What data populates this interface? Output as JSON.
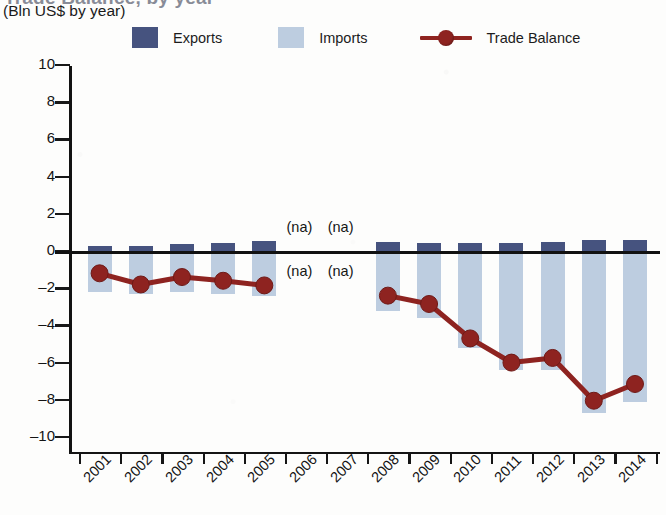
{
  "header": {
    "title_clipped": "Trade Balance, by year",
    "subtitle": "(Bln US$ by year)"
  },
  "legend": {
    "items": [
      {
        "label": "Exports",
        "color": "#46537f",
        "marker": "square"
      },
      {
        "label": "Imports",
        "color": "#bdcde0",
        "marker": "square"
      },
      {
        "label": "Trade Balance",
        "color": "#8e2320",
        "marker": "line-dot"
      }
    ]
  },
  "chart_data": {
    "type": "bar",
    "title": "Trade Balance, by year",
    "subtitle": "(Bln US$ by year)",
    "xlabel": "",
    "ylabel": "Bln US$",
    "ylim": [
      -10,
      10
    ],
    "yticks": [
      10,
      8,
      6,
      4,
      2,
      0,
      -2,
      -4,
      -6,
      -8,
      -10
    ],
    "grid": false,
    "legend_position": "top",
    "categories": [
      "2001",
      "2002",
      "2003",
      "2004",
      "2005",
      "2006",
      "2007",
      "2008",
      "2009",
      "2010",
      "2011",
      "2012",
      "2013",
      "2014"
    ],
    "series": [
      {
        "name": "Exports",
        "color": "#46537f",
        "values": [
          0.25,
          0.25,
          0.35,
          0.45,
          0.55,
          null,
          null,
          0.5,
          0.45,
          0.45,
          0.45,
          0.5,
          0.6,
          0.6
        ]
      },
      {
        "name": "Imports",
        "color": "#bdcde0",
        "values": [
          -2.2,
          -2.3,
          -2.2,
          -2.3,
          -2.4,
          null,
          null,
          -3.2,
          -3.6,
          -5.2,
          -6.4,
          -6.4,
          -8.7,
          -8.1
        ]
      },
      {
        "name": "Trade Balance",
        "color": "#8e2320",
        "values": [
          -1.2,
          -1.8,
          -1.4,
          -1.6,
          -1.85,
          null,
          null,
          -2.4,
          -2.85,
          -4.7,
          -6.0,
          -5.75,
          -8.05,
          -7.15
        ]
      }
    ],
    "na_labels": [
      {
        "category": "2006",
        "position": "above-zero",
        "text": "(na)"
      },
      {
        "category": "2007",
        "position": "above-zero",
        "text": "(na)"
      },
      {
        "category": "2006",
        "position": "below-zero",
        "text": "(na)"
      },
      {
        "category": "2007",
        "position": "below-zero",
        "text": "(na)"
      }
    ],
    "na_text": "(na)"
  }
}
